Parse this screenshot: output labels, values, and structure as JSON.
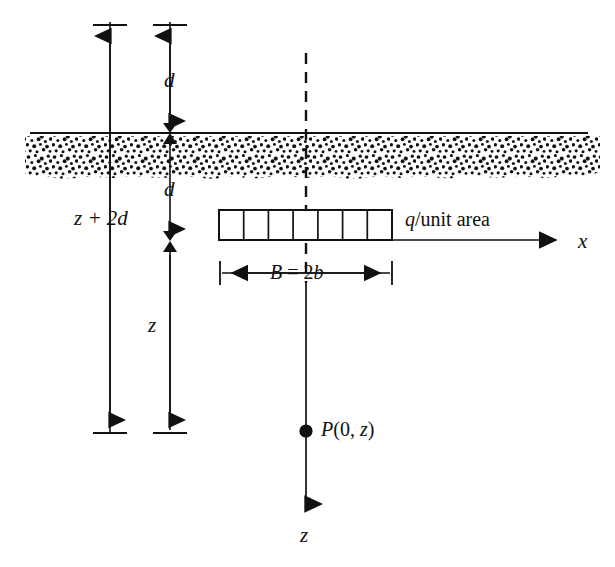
{
  "figure": {
    "type": "engineering-cross-section",
    "colors": {
      "line": "#111111",
      "background": "#ffffff",
      "soil_stipple": "#111111"
    }
  },
  "labels": {
    "depth_top": "d",
    "depth_bottom": "d",
    "total_depth": "z + 2d",
    "depth_below_footing": "z",
    "load": "q/unit area",
    "width": "B = 2b",
    "point": "P(0, z)",
    "axis_x": "x",
    "axis_z": "z"
  },
  "geometry": {
    "ground_line_y": 132,
    "soil_band_top": 136,
    "soil_band_bottom": 178,
    "footing_top_y": 210,
    "footing_bottom_y": 240,
    "footing_left_x": 219,
    "footing_right_x": 392,
    "footing_cells": 7,
    "centerline_x": 306,
    "point_y": 431,
    "axis_x_end": 567,
    "axis_z_end": 515
  },
  "annotations": {
    "dimension_lines": [
      {
        "name": "z-plus-2d",
        "x": 110,
        "top_y": 25,
        "bottom_y": 431
      },
      {
        "name": "d-and-z",
        "x": 170,
        "top_y": 25,
        "bottom_y": 431
      }
    ]
  }
}
